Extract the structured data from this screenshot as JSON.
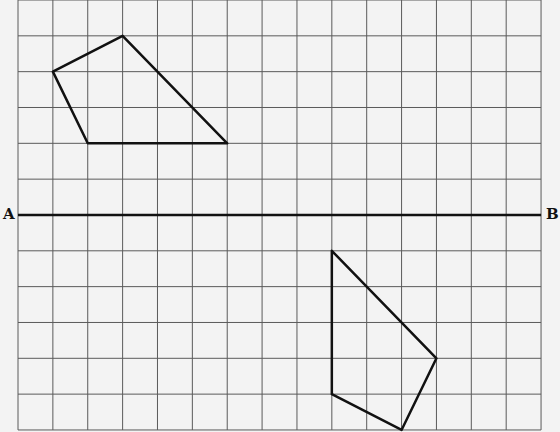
{
  "diagram": {
    "type": "grid-reflection",
    "grid": {
      "origin_x": 18,
      "origin_y": 0,
      "cols": 15,
      "rows": 12,
      "cell_w": 34.87,
      "cell_h": 35.83,
      "line_color": "#5a5a5a",
      "background": "#f3f3f3"
    },
    "mirror_line": {
      "row": 6,
      "from_label": "A",
      "to_label": "B",
      "color": "#111111"
    },
    "shapes": [
      {
        "name": "upper-quadrilateral",
        "vertices_grid": [
          [
            3,
            1
          ],
          [
            6,
            4
          ],
          [
            2,
            4
          ],
          [
            1,
            2
          ]
        ],
        "stroke": "#111111"
      },
      {
        "name": "lower-quadrilateral",
        "vertices_grid": [
          [
            9,
            7
          ],
          [
            12,
            10
          ],
          [
            11,
            12
          ],
          [
            9,
            11
          ]
        ],
        "stroke": "#111111"
      }
    ]
  },
  "labels": {
    "a": "A",
    "b": "B"
  }
}
